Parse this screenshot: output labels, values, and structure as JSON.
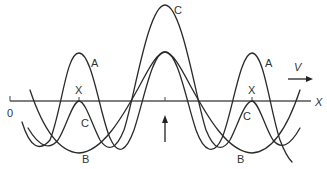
{
  "diagram": {
    "title": "",
    "axis": {
      "origin_label": "0",
      "axis_label": "X"
    },
    "velocity": {
      "label": "V",
      "direction": "right"
    },
    "center_arrow": {
      "direction": "up"
    },
    "curves": [
      {
        "id": "A",
        "label": "A",
        "description": "oscillating wave with peaks near both X markers and a broad peak at center"
      },
      {
        "id": "B",
        "label": "B",
        "description": "wave with troughs below each X marker"
      },
      {
        "id": "C",
        "label": "C",
        "description": "wave with tall peak at center and small peaks at X markers"
      }
    ],
    "labels": {
      "A_left": "A",
      "A_right": "A",
      "B_left": "B",
      "B_right": "B",
      "C_top": "C",
      "C_left": "C",
      "C_right": "C",
      "X_left": "X",
      "X_right": "X"
    },
    "colors": {
      "stroke": "#2a2a2a",
      "axis": "#555555",
      "background": "#ffffff"
    }
  }
}
